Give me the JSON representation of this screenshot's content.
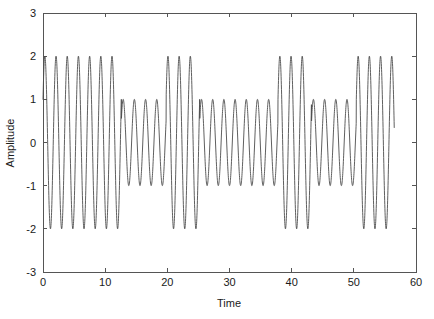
{
  "chart_data": {
    "type": "line",
    "title": "",
    "subtitle": "",
    "xlabel": "Time",
    "ylabel": "Amplitude",
    "xlim": [
      0,
      60
    ],
    "ylim": [
      -3,
      3
    ],
    "xticks": [
      0,
      10,
      20,
      30,
      40,
      50,
      60
    ],
    "xtick_labels": [
      "0",
      "10",
      "20",
      "30",
      "40",
      "50",
      "60"
    ],
    "yticks": [
      -3,
      -2,
      -1,
      0,
      1,
      2,
      3
    ],
    "ytick_labels": [
      "-3",
      "-2",
      "-1",
      "0",
      "1",
      "2",
      "3"
    ],
    "grid": false,
    "legend": false,
    "legend_position": "none",
    "line_color": "#4d4d4d",
    "background_color": "#ffffff",
    "axis_color": "#555555",
    "signal": {
      "carrier_period": 1.8,
      "carrier_phase_deg": 30,
      "t_start": 0,
      "t_end": 56.5,
      "sample_step": 0.02,
      "envelope_levels": [
        2,
        1
      ],
      "segments": [
        {
          "t_start": 0.0,
          "t_end": 12.6,
          "amplitude": 2
        },
        {
          "t_start": 12.6,
          "t_end": 19.8,
          "amplitude": 1
        },
        {
          "t_start": 19.8,
          "t_end": 25.2,
          "amplitude": 2
        },
        {
          "t_start": 25.2,
          "t_end": 37.8,
          "amplitude": 1
        },
        {
          "t_start": 37.8,
          "t_end": 43.2,
          "amplitude": 2
        },
        {
          "t_start": 43.2,
          "t_end": 50.4,
          "amplitude": 1
        },
        {
          "t_start": 50.4,
          "t_end": 56.5,
          "amplitude": 2
        }
      ]
    },
    "series": [
      {
        "name": "signal",
        "color": "#4d4d4d",
        "peaks_amplitude_2": [
          0.45,
          2.25,
          4.05,
          5.85,
          7.65,
          9.45,
          11.25,
          20.25,
          22.05,
          23.85,
          38.25,
          40.05,
          41.85,
          50.85,
          52.65,
          54.45
        ],
        "peaks_amplitude_1": [
          13.05,
          14.85,
          16.65,
          18.45,
          25.65,
          27.45,
          29.25,
          31.05,
          32.85,
          34.65,
          36.45,
          43.65,
          45.45,
          47.25,
          49.05
        ],
        "troughs_amplitude_2": [
          1.35,
          3.15,
          4.95,
          6.75,
          8.55,
          10.35,
          12.15,
          19.35,
          21.15,
          22.95,
          24.75,
          39.15,
          40.95,
          42.75,
          51.75,
          53.55,
          55.35
        ],
        "troughs_amplitude_1": [
          13.95,
          15.75,
          17.55,
          26.55,
          28.35,
          30.15,
          31.95,
          33.75,
          35.55,
          37.35,
          44.55,
          46.35,
          48.15,
          49.95
        ]
      }
    ]
  },
  "figure": {
    "plot_area": {
      "left": 43,
      "top": 13,
      "right": 416,
      "bottom": 272
    }
  }
}
